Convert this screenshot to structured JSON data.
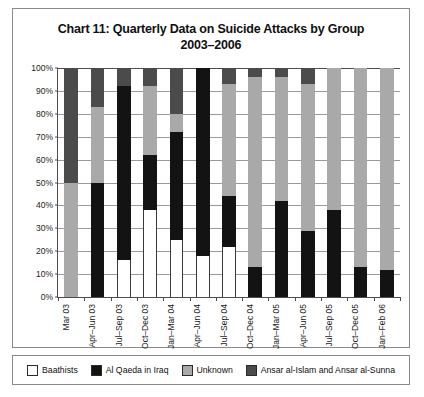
{
  "chart_data": {
    "type": "bar",
    "stacked": true,
    "title": "Chart 11: Quarterly Data on Suicide Attacks by Group",
    "subtitle": "2003–2006",
    "xlabel": "",
    "ylabel": "",
    "ylim": [
      0,
      100
    ],
    "ytick_labels": [
      "0%",
      "10%",
      "20%",
      "30%",
      "40%",
      "50%",
      "60%",
      "70%",
      "80%",
      "90%",
      "100%"
    ],
    "ytick_values": [
      0,
      10,
      20,
      30,
      40,
      50,
      60,
      70,
      80,
      90,
      100
    ],
    "grid": true,
    "legend_position": "bottom",
    "categories": [
      "Mar 03",
      "Apr–Jun 03",
      "Jul–Sep 03",
      "Oct–Dec 03",
      "Jan–Mar 04",
      "Apr–Jun 04",
      "Jul–Sep 04",
      "Oct–Dec 04",
      "Jan–Mar 05",
      "Apr–Jun 05",
      "Jul–Sep 05",
      "Oct–Dec 05",
      "Jan–Feb 06"
    ],
    "series": [
      {
        "name": "Baathists",
        "color": "#ffffff",
        "values": [
          0,
          0,
          16,
          38,
          25,
          18,
          22,
          0,
          0,
          0,
          0,
          0,
          0
        ]
      },
      {
        "name": "Al Qaeda in Iraq",
        "color": "#131313",
        "values": [
          0,
          50,
          76,
          24,
          47,
          82,
          22,
          13,
          42,
          29,
          38,
          13,
          12
        ]
      },
      {
        "name": "Unknown",
        "color": "#a9a9a9",
        "values": [
          50,
          33,
          0,
          30,
          8,
          0,
          49,
          83,
          54,
          64,
          62,
          87,
          88
        ]
      },
      {
        "name": "Ansar al-Islam and Ansar al-Sunna",
        "color": "#4b4b4b",
        "values": [
          50,
          17,
          8,
          8,
          20,
          0,
          7,
          4,
          4,
          7,
          0,
          0,
          0
        ]
      }
    ]
  },
  "legend": {
    "items": [
      {
        "label": "Baathists",
        "color": "#ffffff"
      },
      {
        "label": "Al Qaeda in Iraq",
        "color": "#131313"
      },
      {
        "label": "Unknown",
        "color": "#a9a9a9"
      },
      {
        "label": "Ansar al-Islam and Ansar al-Sunna",
        "color": "#4b4b4b"
      }
    ]
  }
}
